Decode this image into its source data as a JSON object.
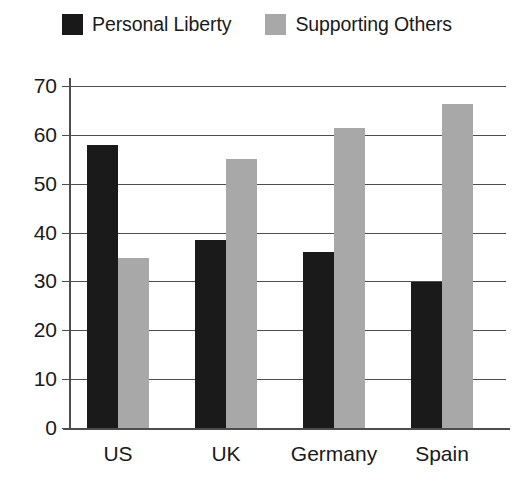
{
  "chart_data": {
    "type": "bar",
    "title": "",
    "xlabel": "",
    "ylabel": "",
    "categories": [
      "US",
      "UK",
      "Germany",
      "Spain"
    ],
    "series": [
      {
        "name": "Personal Liberty",
        "color": "#1a1a1a",
        "values": [
          58.0,
          38.4,
          36.0,
          29.8
        ]
      },
      {
        "name": "Supporting Others",
        "color": "#a8a8a8",
        "values": [
          34.8,
          55.0,
          61.5,
          66.3
        ]
      }
    ],
    "ylim": [
      0,
      70
    ],
    "yticks": [
      0,
      10,
      20,
      30,
      40,
      50,
      60,
      70
    ],
    "ytick_labels": [
      "0",
      "10",
      "20",
      "30",
      "40",
      "50",
      "60",
      "70"
    ],
    "grid": true,
    "legend_position": "top-center"
  },
  "legend": {
    "entries": [
      {
        "label": "Personal Liberty",
        "swatch": "black-square-swatch"
      },
      {
        "label": "Supporting Others",
        "swatch": "gray-square-swatch"
      }
    ]
  },
  "axes": {
    "y_tick_labels": [
      "70",
      "60",
      "50",
      "40",
      "30",
      "20",
      "10",
      "0"
    ],
    "x_tick_labels": [
      "US",
      "UK",
      "Germany",
      "Spain"
    ]
  }
}
